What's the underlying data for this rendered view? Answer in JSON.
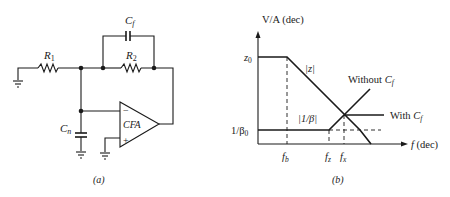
{
  "figure_a": {
    "caption": "(a)",
    "components": {
      "r1": {
        "name": "R",
        "sub": "1"
      },
      "r2": {
        "name": "R",
        "sub": "2"
      },
      "cf": {
        "name": "C",
        "sub": "f"
      },
      "cn": {
        "name": "C",
        "sub": "n"
      },
      "amp": {
        "label": "CFA",
        "minus": "−",
        "plus": "+"
      }
    }
  },
  "figure_b": {
    "caption": "(b)",
    "y_axis_label": "V/A (dec)",
    "x_axis_label_var": "f",
    "x_axis_label_unit": " (dec)",
    "y_ticks": {
      "z0": {
        "name": "z",
        "sub": "0"
      },
      "inv_beta0": {
        "name": "1/β",
        "sub": "0"
      }
    },
    "x_ticks": {
      "fb": {
        "name": "f",
        "sub": "b"
      },
      "fz": {
        "name": "f",
        "sub": "z"
      },
      "fx": {
        "name": "f",
        "sub": "x"
      }
    },
    "curve_labels": {
      "z": "|z|",
      "inv_beta": "|1/β|",
      "without_cf": {
        "text": "Without ",
        "name": "C",
        "sub": "f"
      },
      "with_cf": {
        "text": "With ",
        "name": "C",
        "sub": "f"
      }
    }
  }
}
